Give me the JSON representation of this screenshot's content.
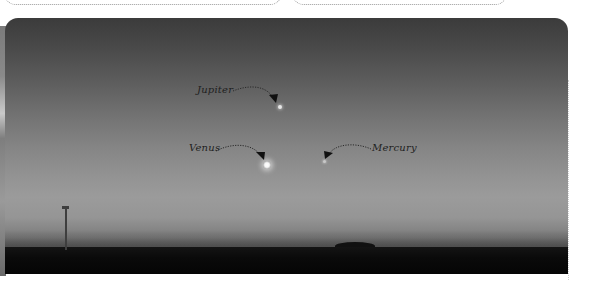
{
  "top_boxes": [
    {
      "id": "left",
      "content": ""
    },
    {
      "id": "right",
      "content": ""
    }
  ],
  "photo": {
    "subject": "twilight sky over flat horizon with planets",
    "labels": {
      "jupiter": "Jupiter",
      "venus": "Venus",
      "mercury": "Mercury"
    }
  },
  "colors": {
    "sky_top": "#3b3b3b",
    "sky_horizon": "#9b9b9b",
    "ground": "#0a0a0a",
    "label_text": "#1e1e1e",
    "box_border": "#9a9a9a"
  }
}
